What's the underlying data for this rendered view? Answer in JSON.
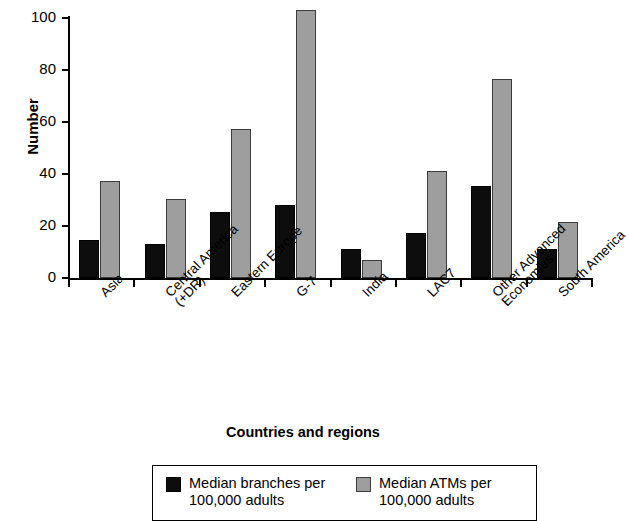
{
  "chart_data": {
    "type": "bar",
    "title": "",
    "xlabel": "Countries and regions",
    "ylabel": "Number",
    "ylim": [
      0,
      100
    ],
    "yticks": [
      0,
      20,
      40,
      60,
      80,
      100
    ],
    "grid": false,
    "legend_position": "bottom",
    "categories": [
      "Asia",
      "Central America\n(+DR)",
      "Eastern Europe",
      "G-7",
      "India",
      "LAC7",
      "Other Advanced\nEconomies",
      "South America"
    ],
    "series": [
      {
        "name": "Median branches per\n100,000 adults",
        "short_name": "Median branches per 100,000 adults",
        "color": "#0d0d0d",
        "values": [
          14.5,
          13,
          25.5,
          28,
          11,
          17.5,
          35.5,
          11
        ]
      },
      {
        "name": "Median ATMs per\n100,000 adults",
        "short_name": "Median ATMs per 100,000 adults",
        "color": "#9e9e9e",
        "values": [
          37.5,
          30.5,
          57.5,
          103,
          7,
          41,
          76.5,
          21.5
        ]
      }
    ]
  },
  "axes": {
    "y_title": "Number",
    "x_title": "Countries and regions",
    "y_tick_labels": [
      "0",
      "20",
      "40",
      "60",
      "80",
      "100"
    ]
  },
  "legend": {
    "entries": [
      {
        "label": "Median branches per\n100,000 adults",
        "color": "#0d0d0d"
      },
      {
        "label": "Median ATMs per\n100,000 adults",
        "color": "#9e9e9e"
      }
    ]
  }
}
